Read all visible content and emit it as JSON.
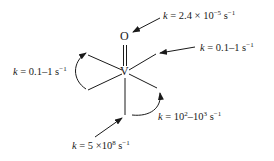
{
  "diagram": {
    "center_atom": "V",
    "apical_atom": "O",
    "labels": {
      "oxo": {
        "k": "k",
        "eq": " = 2.4 × 10",
        "exp": "−5",
        "unit": " s",
        "unit_exp": "−1"
      },
      "upper_right": {
        "k": "k",
        "eq": " = 0.1–1 s",
        "unit_exp": "−1"
      },
      "left": {
        "k": "k",
        "eq": " = 0.1–1 s",
        "unit_exp": "−1"
      },
      "lower_right": {
        "k": "k",
        "eq": " = 10",
        "exp1": "2",
        "mid": "–10",
        "exp2": "3",
        "unit": " s",
        "unit_exp": "−1"
      },
      "bottom": {
        "k": "k",
        "eq": " = 5 ×10",
        "exp": "8",
        "unit": " s",
        "unit_exp": "−1"
      }
    },
    "colors": {
      "ink": "#1a1a1a",
      "background": "#ffffff"
    }
  }
}
